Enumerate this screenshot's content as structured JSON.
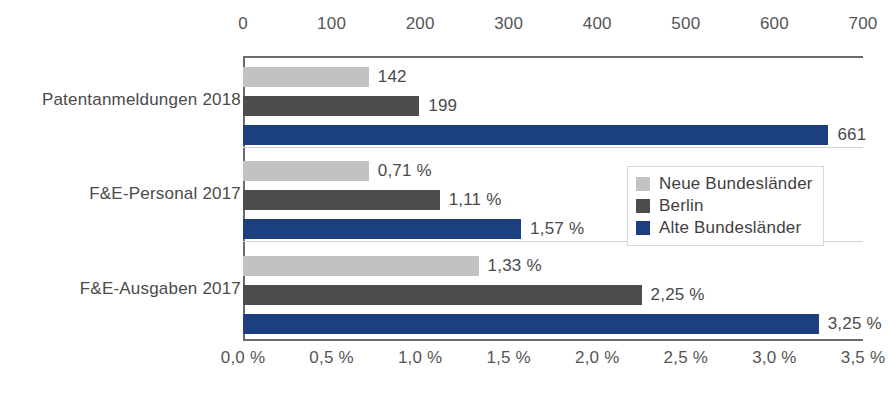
{
  "chart_data": {
    "type": "bar",
    "orientation": "horizontal",
    "title": "",
    "subtitle": "",
    "xlabel": "",
    "ylabel": "",
    "grid": false,
    "legend_position": "inside-right",
    "categories": [
      "Patentanmeldungen 2018",
      "F&E-Personal 2017",
      "F&E-Ausgaben 2017"
    ],
    "series": [
      {
        "name": "Neue Bundesländer",
        "color": "#c2c2c2",
        "values": [
          142,
          0.71,
          1.33
        ],
        "labels": [
          "142",
          "0,71 %",
          "1,33 %"
        ]
      },
      {
        "name": "Berlin",
        "color": "#4d4d4d",
        "values": [
          199,
          1.11,
          2.25
        ],
        "labels": [
          "199",
          "1,11 %",
          "2,25 %"
        ]
      },
      {
        "name": "Alte Bundesländer",
        "color": "#1c3f80",
        "values": [
          661,
          1.57,
          3.25
        ],
        "labels": [
          "661",
          "1,57 %",
          "3,25 %"
        ]
      }
    ],
    "axes": [
      {
        "position": "top",
        "applies_to_category": "Patentanmeldungen 2018",
        "ticks": [
          0,
          100,
          200,
          300,
          400,
          500,
          600,
          700
        ],
        "tick_labels": [
          "0",
          "100",
          "200",
          "300",
          "400",
          "500",
          "600",
          "700"
        ],
        "range": [
          0,
          700
        ]
      },
      {
        "position": "bottom",
        "applies_to_categories": [
          "F&E-Personal 2017",
          "F&E-Ausgaben 2017"
        ],
        "ticks": [
          0.0,
          0.5,
          1.0,
          1.5,
          2.0,
          2.5,
          3.0,
          3.5
        ],
        "tick_labels": [
          "0,0 %",
          "0,5 %",
          "1,0 %",
          "1,5 %",
          "2,0 %",
          "2,5 %",
          "3,0 %",
          "3,5 %"
        ],
        "range": [
          0.0,
          3.5
        ]
      }
    ]
  },
  "legend": {
    "items": [
      {
        "label": "Neue Bundesländer",
        "color": "#c2c2c2"
      },
      {
        "label": "Berlin",
        "color": "#4d4d4d"
      },
      {
        "label": "Alte Bundesländer",
        "color": "#1c3f80"
      }
    ]
  },
  "colors": {
    "series_light_gray": "#c2c2c2",
    "series_dark_gray": "#4d4d4d",
    "series_blue": "#1c3f80",
    "axis": "#6a6a6a",
    "text": "#4a4a4a",
    "separator": "#d4d4d4",
    "background": "#ffffff"
  }
}
